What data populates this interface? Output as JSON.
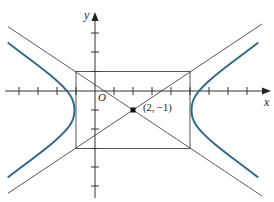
{
  "diagram": {
    "type": "hyperbola-graph",
    "axes": {
      "x_label": "x",
      "y_label": "y",
      "origin_label": "O",
      "tick_spacing_units": 1
    },
    "center": {
      "x": 2,
      "y": -1,
      "label": "(2, −1)"
    },
    "hyperbola": {
      "orientation": "horizontal",
      "a": 3,
      "b": 2,
      "vertices": [
        [
          -1,
          -1
        ],
        [
          5,
          -1
        ]
      ],
      "asymptote_slopes": [
        "2/3",
        "-2/3"
      ]
    },
    "fundamental_rectangle": {
      "x_range": [
        -1,
        5
      ],
      "y_range": [
        -3,
        1
      ]
    },
    "colors": {
      "curve": "#2e6a8e",
      "lines": "#444444",
      "axes": "#333333",
      "background": "#ffffff"
    }
  }
}
